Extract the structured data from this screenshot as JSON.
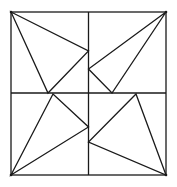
{
  "figure": {
    "stroke_color": "#1a1a1a",
    "background_color": "#ffffff",
    "quadrants": [
      {
        "name": "top-left",
        "triangle": "corner to vertical midline to horizontal midline"
      },
      {
        "name": "top-right",
        "triangle": "corner to vertical midline to horizontal midline"
      },
      {
        "name": "bottom-left",
        "triangle": "corner to horizontal midline to vertical midline"
      },
      {
        "name": "bottom-right",
        "triangle": "corner to horizontal midline to vertical midline"
      }
    ]
  }
}
